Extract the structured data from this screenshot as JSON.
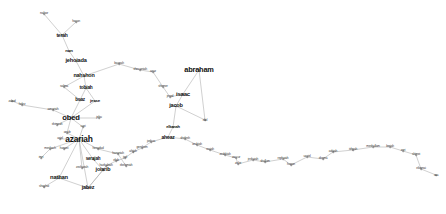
{
  "figure": {
    "type": "network-graph",
    "title": "",
    "background_color": "#ffffff",
    "edge_color": "#b0b0b0",
    "label_color": "#111111",
    "width": 446,
    "height": 214
  },
  "chart_data": {
    "type": "scatter",
    "title": "",
    "xlabel": "",
    "ylabel": "",
    "layout": "force-directed node-link graph of biblical genealogy names",
    "grid": false,
    "legend": false,
    "xlim": [
      0,
      446
    ],
    "ylim": [
      0,
      214
    ],
    "nodes": [
      {
        "id": "nahor",
        "label": "nahor",
        "x": 44,
        "y": 14,
        "size": 3.6,
        "weight": 1
      },
      {
        "id": "haran",
        "label": "haran",
        "x": 76,
        "y": 22,
        "size": 3.4,
        "weight": 1
      },
      {
        "id": "terah",
        "label": "terah",
        "x": 62,
        "y": 35,
        "size": 5.0,
        "weight": 3
      },
      {
        "id": "nun",
        "label": "nun",
        "x": 69,
        "y": 51,
        "size": 4.4,
        "weight": 2
      },
      {
        "id": "jehoiada",
        "label": "jehoiada",
        "x": 76,
        "y": 61,
        "size": 5.6,
        "weight": 3
      },
      {
        "id": "nahshon",
        "label": "nahshon",
        "x": 84,
        "y": 76,
        "size": 5.4,
        "weight": 3
      },
      {
        "id": "salma",
        "label": "salma",
        "x": 64,
        "y": 87,
        "size": 3.4,
        "weight": 1
      },
      {
        "id": "tobiah",
        "label": "tobiah",
        "x": 86,
        "y": 88,
        "size": 4.8,
        "weight": 2
      },
      {
        "id": "boaz",
        "label": "boaz",
        "x": 80,
        "y": 100,
        "size": 4.6,
        "weight": 2
      },
      {
        "id": "jesse",
        "label": "jesse",
        "x": 95,
        "y": 101,
        "size": 4.4,
        "weight": 2
      },
      {
        "id": "obed",
        "label": "obed",
        "x": 71,
        "y": 118,
        "size": 7.6,
        "weight": 6
      },
      {
        "id": "amariah",
        "label": "amariah",
        "x": 53,
        "y": 110,
        "size": 3.4,
        "weight": 1
      },
      {
        "id": "helez",
        "label": "helez",
        "x": 22,
        "y": 105,
        "size": 3.2,
        "weight": 1
      },
      {
        "id": "zabad",
        "label": "zabad",
        "x": 12,
        "y": 101,
        "size": 3.0,
        "weight": 1
      },
      {
        "id": "jehu",
        "label": "jehu",
        "x": 99,
        "y": 118,
        "size": 3.4,
        "weight": 1
      },
      {
        "id": "shimeah",
        "label": "shimeah",
        "x": 57,
        "y": 125,
        "size": 3.2,
        "weight": 1
      },
      {
        "id": "uzzi",
        "label": "uzzi",
        "x": 83,
        "y": 127,
        "size": 3.2,
        "weight": 1
      },
      {
        "id": "anub",
        "label": "anub",
        "x": 67,
        "y": 133,
        "size": 3.4,
        "weight": 1
      },
      {
        "id": "azariah",
        "label": "azariah",
        "x": 79,
        "y": 139,
        "size": 8.4,
        "weight": 8
      },
      {
        "id": "asiel",
        "label": "asiel",
        "x": 60,
        "y": 139,
        "size": 3.2,
        "weight": 1
      },
      {
        "id": "meshach",
        "label": "meshach",
        "x": 50,
        "y": 149,
        "size": 3.2,
        "weight": 1
      },
      {
        "id": "hanani",
        "label": "hanani",
        "x": 64,
        "y": 149,
        "size": 3.2,
        "weight": 1
      },
      {
        "id": "imri",
        "label": "imri",
        "x": 41,
        "y": 158,
        "size": 3.2,
        "weight": 1
      },
      {
        "id": "henadad",
        "label": "henadad",
        "x": 98,
        "y": 149,
        "size": 3.2,
        "weight": 1
      },
      {
        "id": "serajah",
        "label": "serajah",
        "x": 93,
        "y": 159,
        "size": 4.6,
        "weight": 2
      },
      {
        "id": "hananiah",
        "label": "hananiah",
        "x": 118,
        "y": 154,
        "size": 3.2,
        "weight": 1
      },
      {
        "id": "shelemiah",
        "label": "shelemiah",
        "x": 126,
        "y": 166,
        "size": 3.2,
        "weight": 1
      },
      {
        "id": "zechariah",
        "label": "zechariah",
        "x": 82,
        "y": 168,
        "size": 3.2,
        "weight": 1
      },
      {
        "id": "joiarib",
        "label": "joiarib",
        "x": 103,
        "y": 170,
        "size": 5.4,
        "weight": 3
      },
      {
        "id": "nathan",
        "label": "nathan",
        "x": 59,
        "y": 178,
        "size": 5.8,
        "weight": 4
      },
      {
        "id": "shaphat",
        "label": "shaphat",
        "x": 44,
        "y": 187,
        "size": 3.2,
        "weight": 1
      },
      {
        "id": "jabez",
        "label": "jabez",
        "x": 88,
        "y": 188,
        "size": 5.4,
        "weight": 3
      },
      {
        "id": "baanah",
        "label": "baanah",
        "x": 119,
        "y": 64,
        "size": 3.2,
        "weight": 1
      },
      {
        "id": "shecaniah",
        "label": "shecaniah",
        "x": 140,
        "y": 70,
        "size": 3.4,
        "weight": 1
      },
      {
        "id": "azaz",
        "label": "azaz",
        "x": 153,
        "y": 72,
        "size": 3.2,
        "weight": 1
      },
      {
        "id": "shemer",
        "label": "shemer",
        "x": 163,
        "y": 87,
        "size": 3.2,
        "weight": 1
      },
      {
        "id": "jered",
        "label": "jered",
        "x": 170,
        "y": 97,
        "size": 3.4,
        "weight": 1
      },
      {
        "id": "abraham",
        "label": "abraham",
        "x": 199,
        "y": 70,
        "size": 7.4,
        "weight": 6
      },
      {
        "id": "isaac",
        "label": "isaac",
        "x": 183,
        "y": 94,
        "size": 6.0,
        "weight": 4
      },
      {
        "id": "jacob",
        "label": "jacob",
        "x": 176,
        "y": 106,
        "size": 5.6,
        "weight": 4
      },
      {
        "id": "elkanah",
        "label": "elkanah",
        "x": 173,
        "y": 127,
        "size": 4.0,
        "weight": 2
      },
      {
        "id": "ahoaz",
        "label": "ahoaz",
        "x": 168,
        "y": 137,
        "size": 5.0,
        "weight": 3
      },
      {
        "id": "joshua",
        "label": "joshua",
        "x": 151,
        "y": 142,
        "size": 3.2,
        "weight": 1
      },
      {
        "id": "gershom",
        "label": "gershom",
        "x": 142,
        "y": 148,
        "size": 3.2,
        "weight": 1
      },
      {
        "id": "ahijah",
        "label": "ahijah",
        "x": 133,
        "y": 152,
        "size": 3.2,
        "weight": 1
      },
      {
        "id": "joel",
        "label": "joel",
        "x": 125,
        "y": 158,
        "size": 3.2,
        "weight": 1
      },
      {
        "id": "eliab",
        "label": "eliab",
        "x": 116,
        "y": 161,
        "size": 3.2,
        "weight": 1
      },
      {
        "id": "hashabiah",
        "label": "hashabiah",
        "x": 106,
        "y": 166,
        "size": 3.2,
        "weight": 1
      },
      {
        "id": "shelesh",
        "label": "shelesh",
        "x": 185,
        "y": 139,
        "size": 3.2,
        "weight": 1
      },
      {
        "id": "izrahiah",
        "label": "izrahiah",
        "x": 197,
        "y": 145,
        "size": 3.2,
        "weight": 1
      },
      {
        "id": "reaiah",
        "label": "reaiah",
        "x": 210,
        "y": 150,
        "size": 3.2,
        "weight": 1
      },
      {
        "id": "zedekiah",
        "label": "zedekiah",
        "x": 225,
        "y": 155,
        "size": 3.2,
        "weight": 1
      },
      {
        "id": "zaccur",
        "label": "zaccur",
        "x": 236,
        "y": 158,
        "size": 3.2,
        "weight": 1
      },
      {
        "id": "jeshaiah",
        "label": "jeshaiah",
        "x": 253,
        "y": 160,
        "size": 3.2,
        "weight": 1
      },
      {
        "id": "zichri",
        "label": "zichri",
        "x": 238,
        "y": 164,
        "size": 3.2,
        "weight": 1
      },
      {
        "id": "shallum",
        "label": "shallum",
        "x": 265,
        "y": 162,
        "size": 3.2,
        "weight": 1
      },
      {
        "id": "rephaiah",
        "label": "rephaiah",
        "x": 283,
        "y": 159,
        "size": 3.2,
        "weight": 1
      },
      {
        "id": "hanan",
        "label": "hanan",
        "x": 291,
        "y": 165,
        "size": 3.2,
        "weight": 1
      },
      {
        "id": "uzziel",
        "label": "uzziel",
        "x": 307,
        "y": 157,
        "size": 3.2,
        "weight": 1
      },
      {
        "id": "shema",
        "label": "shema",
        "x": 323,
        "y": 159,
        "size": 3.2,
        "weight": 1
      },
      {
        "id": "adaiah",
        "label": "adaiah",
        "x": 333,
        "y": 152,
        "size": 3.2,
        "weight": 1
      },
      {
        "id": "ishpah",
        "label": "ishpah",
        "x": 353,
        "y": 150,
        "size": 3.2,
        "weight": 1
      },
      {
        "id": "meshullam",
        "label": "meshullam",
        "x": 373,
        "y": 147,
        "size": 3.2,
        "weight": 1
      },
      {
        "id": "beriah",
        "label": "beriah",
        "x": 390,
        "y": 147,
        "size": 3.2,
        "weight": 1
      },
      {
        "id": "zeri",
        "label": "zeri",
        "x": 403,
        "y": 151,
        "size": 3.2,
        "weight": 1
      },
      {
        "id": "shimei",
        "label": "shimei",
        "x": 416,
        "y": 155,
        "size": 3.2,
        "weight": 1
      },
      {
        "id": "elioenai",
        "label": "elioenai",
        "x": 421,
        "y": 169,
        "size": 3.2,
        "weight": 1
      },
      {
        "id": "asa",
        "label": "asa",
        "x": 436,
        "y": 175,
        "size": 3.0,
        "weight": 1
      },
      {
        "id": "eliel",
        "label": "eliel",
        "x": 205,
        "y": 120,
        "size": 3.0,
        "weight": 1
      }
    ],
    "edges": [
      [
        "nahor",
        "terah"
      ],
      [
        "haran",
        "terah"
      ],
      [
        "terah",
        "nun"
      ],
      [
        "nun",
        "jehoiada"
      ],
      [
        "jehoiada",
        "nahshon"
      ],
      [
        "nahshon",
        "tobiah"
      ],
      [
        "nahshon",
        "salma"
      ],
      [
        "salma",
        "boaz"
      ],
      [
        "tobiah",
        "jesse"
      ],
      [
        "tobiah",
        "boaz"
      ],
      [
        "boaz",
        "obed"
      ],
      [
        "jesse",
        "obed"
      ],
      [
        "obed",
        "amariah"
      ],
      [
        "amariah",
        "helez"
      ],
      [
        "helez",
        "zabad"
      ],
      [
        "obed",
        "jehu"
      ],
      [
        "obed",
        "shimeah"
      ],
      [
        "obed",
        "uzzi"
      ],
      [
        "obed",
        "anub"
      ],
      [
        "anub",
        "azariah"
      ],
      [
        "uzzi",
        "azariah"
      ],
      [
        "azariah",
        "asiel"
      ],
      [
        "azariah",
        "hanani"
      ],
      [
        "azariah",
        "meshach"
      ],
      [
        "meshach",
        "imri"
      ],
      [
        "azariah",
        "henadad"
      ],
      [
        "azariah",
        "serajah"
      ],
      [
        "serajah",
        "joiarib"
      ],
      [
        "henadad",
        "hananiah"
      ],
      [
        "hananiah",
        "shelemiah"
      ],
      [
        "azariah",
        "zechariah"
      ],
      [
        "azariah",
        "nathan"
      ],
      [
        "nathan",
        "shaphat"
      ],
      [
        "nathan",
        "jabez"
      ],
      [
        "jabez",
        "joiarib"
      ],
      [
        "joiarib",
        "jabez"
      ],
      [
        "azariah",
        "jabez"
      ],
      [
        "nahshon",
        "baanah"
      ],
      [
        "baanah",
        "shecaniah"
      ],
      [
        "shecaniah",
        "azaz"
      ],
      [
        "azaz",
        "shemer"
      ],
      [
        "shemer",
        "jered"
      ],
      [
        "jered",
        "isaac"
      ],
      [
        "abraham",
        "isaac"
      ],
      [
        "isaac",
        "jacob"
      ],
      [
        "jacob",
        "elkanah"
      ],
      [
        "elkanah",
        "ahoaz"
      ],
      [
        "ahoaz",
        "joshua"
      ],
      [
        "joshua",
        "gershom"
      ],
      [
        "gershom",
        "ahijah"
      ],
      [
        "ahijah",
        "joel"
      ],
      [
        "joel",
        "eliab"
      ],
      [
        "eliab",
        "hashabiah"
      ],
      [
        "hashabiah",
        "joiarib"
      ],
      [
        "ahoaz",
        "shelesh"
      ],
      [
        "shelesh",
        "izrahiah"
      ],
      [
        "izrahiah",
        "reaiah"
      ],
      [
        "reaiah",
        "zedekiah"
      ],
      [
        "zedekiah",
        "zaccur"
      ],
      [
        "zaccur",
        "zichri"
      ],
      [
        "zichri",
        "jeshaiah"
      ],
      [
        "jeshaiah",
        "shallum"
      ],
      [
        "shallum",
        "rephaiah"
      ],
      [
        "rephaiah",
        "hanan"
      ],
      [
        "hanan",
        "uzziel"
      ],
      [
        "uzziel",
        "shema"
      ],
      [
        "shema",
        "adaiah"
      ],
      [
        "adaiah",
        "ishpah"
      ],
      [
        "ishpah",
        "meshullam"
      ],
      [
        "meshullam",
        "beriah"
      ],
      [
        "beriah",
        "zeri"
      ],
      [
        "zeri",
        "shimei"
      ],
      [
        "shimei",
        "elioenai"
      ],
      [
        "elioenai",
        "asa"
      ],
      [
        "abraham",
        "eliel"
      ],
      [
        "eliel",
        "jacob"
      ]
    ]
  }
}
